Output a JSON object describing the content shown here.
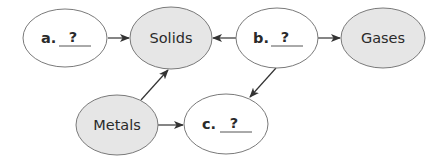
{
  "diagram": {
    "colors": {
      "shaded_fill": "#e6e6e6",
      "blank_fill": "#ffffff",
      "stroke": "#7a7a7a",
      "arrow": "#333333",
      "text": "#2a2a2a"
    },
    "nodes": [
      {
        "id": "a",
        "prefix": "a.",
        "label": "?",
        "type": "blank",
        "cx": 65,
        "cy": 38,
        "rx": 42,
        "ry": 29
      },
      {
        "id": "solids",
        "label": "Solids",
        "type": "shaded",
        "cx": 171,
        "cy": 38,
        "rx": 41,
        "ry": 31
      },
      {
        "id": "b",
        "prefix": "b.",
        "label": "?",
        "type": "blank",
        "cx": 277,
        "cy": 38,
        "rx": 41,
        "ry": 30
      },
      {
        "id": "gases",
        "label": "Gases",
        "type": "shaded",
        "cx": 383,
        "cy": 38,
        "rx": 42,
        "ry": 30
      },
      {
        "id": "metals",
        "label": "Metals",
        "type": "shaded",
        "cx": 117,
        "cy": 125,
        "rx": 41,
        "ry": 30
      },
      {
        "id": "c",
        "prefix": "c.",
        "label": "?",
        "type": "blank",
        "cx": 226,
        "cy": 124,
        "rx": 42,
        "ry": 30
      }
    ],
    "edges": [
      {
        "from": "a",
        "to": "solids",
        "x1": 108,
        "y1": 38,
        "x2": 129,
        "y2": 38
      },
      {
        "from": "b",
        "to": "solids",
        "x1": 236,
        "y1": 38,
        "x2": 213,
        "y2": 38
      },
      {
        "from": "b",
        "to": "gases",
        "x1": 318,
        "y1": 38,
        "x2": 340,
        "y2": 38
      },
      {
        "from": "metals",
        "to": "solids",
        "x1": 141,
        "y1": 100,
        "x2": 168,
        "y2": 70
      },
      {
        "from": "b",
        "to": "c",
        "x1": 276,
        "y1": 68,
        "x2": 250,
        "y2": 97
      },
      {
        "from": "metals",
        "to": "c",
        "x1": 158,
        "y1": 125,
        "x2": 183,
        "y2": 125
      }
    ]
  }
}
